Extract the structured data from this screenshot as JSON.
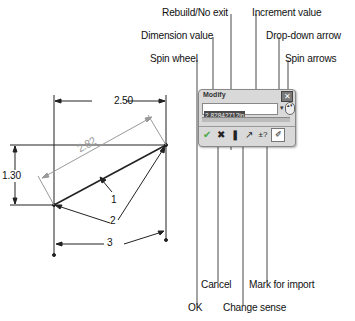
{
  "callouts_top": [
    {
      "label": "Rebuild/No exit"
    },
    {
      "label": "Increment value"
    },
    {
      "label": "Dimension value"
    },
    {
      "label": "Drop-down arrow"
    },
    {
      "label": "Spin wheel"
    },
    {
      "label": "Spin arrows"
    }
  ],
  "callouts_bottom": [
    {
      "label": "Cancel"
    },
    {
      "label": "Mark for import"
    },
    {
      "label": "OK"
    },
    {
      "label": "Change sense"
    }
  ],
  "dialog": {
    "title": "Modify",
    "value": "2.82842712in",
    "close_glyph": "✕",
    "dropdown_glyph": "▾",
    "spin_glyph": "▴▾",
    "buttons": [
      {
        "name": "ok",
        "glyph": "✔"
      },
      {
        "name": "cancel",
        "glyph": "✖"
      },
      {
        "name": "rebuild",
        "glyph": "❚"
      },
      {
        "name": "change-sense",
        "glyph": "↗"
      },
      {
        "name": "increment",
        "glyph": "±?"
      },
      {
        "name": "mark-for-import",
        "glyph": "✐"
      }
    ]
  },
  "sketch": {
    "dimension_horizontal": "2.50",
    "dimension_vertical": "1.30",
    "dimension_aligned": "2.82",
    "callout_1": "1",
    "callout_2": "2",
    "callout_3": "3"
  }
}
